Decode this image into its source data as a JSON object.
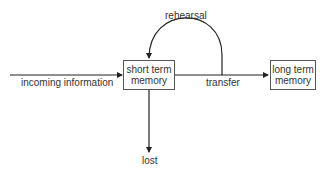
{
  "diagram": {
    "nodes": {
      "short_term": {
        "line1": "short term",
        "line2": "memory"
      },
      "long_term": {
        "line1": "long term",
        "line2": "memory"
      }
    },
    "edges": {
      "incoming": "incoming information",
      "rehearsal": "rehearsal",
      "transfer": "transfer",
      "lost": "lost"
    },
    "colors": {
      "line": "#222222",
      "box_border": "#555555",
      "text": "#333333"
    }
  }
}
